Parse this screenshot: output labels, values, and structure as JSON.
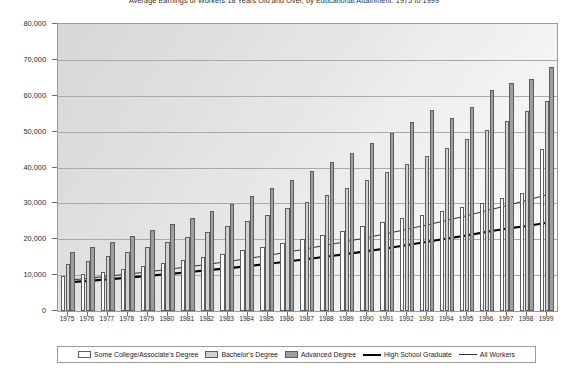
{
  "chart": {
    "title": "Average Earnings of Workers 18 Years Old and Over, by Educational Attainment: 1975 to 1999",
    "y_axis": {
      "labels": [
        "80,000",
        "70,000",
        "60,000",
        "50,000",
        "40,000",
        "30,000",
        "20,000",
        "10,000",
        "0"
      ],
      "min": 0,
      "max": 80000,
      "step": 10000
    }
  },
  "legend": {
    "position": "bottom",
    "items": [
      {
        "label": "Some College/Associate's Degree",
        "marker": "bar",
        "style": "s-some",
        "color": "#ffffff"
      },
      {
        "label": "Bachelor's Degree",
        "marker": "bar",
        "style": "s-bach",
        "color": "#d0d0d0"
      },
      {
        "label": "Advanced Degree",
        "marker": "bar",
        "style": "s-adv",
        "color": "#9e9e9e"
      },
      {
        "label": "High School Graduate",
        "marker": "line-thick",
        "style": "thick",
        "color": "#000000"
      },
      {
        "label": "All Workers",
        "marker": "line-thin",
        "style": "thin",
        "color": "#303030"
      }
    ]
  },
  "chart_data": {
    "type": "bar",
    "title": "Average Earnings of Workers 18 Years Old and Over, by Educational Attainment: 1975 to 1999",
    "xlabel": "",
    "ylabel": "",
    "ylim": [
      0,
      80000
    ],
    "grid": true,
    "legend_position": "bottom",
    "categories": [
      "1975",
      "1976",
      "1977",
      "1978",
      "1979",
      "1980",
      "1981",
      "1982",
      "1983",
      "1984",
      "1985",
      "1986",
      "1987",
      "1988",
      "1989",
      "1990",
      "1991",
      "1992",
      "1993",
      "1994",
      "1995",
      "1996",
      "1997",
      "1998",
      "1999"
    ],
    "series": [
      {
        "name": "Some College/Associate's Degree",
        "type": "bar",
        "color": "#ffffff",
        "values": [
          9700,
          10200,
          10900,
          11700,
          12600,
          13400,
          14300,
          15100,
          16000,
          16900,
          17900,
          19000,
          20100,
          21300,
          22400,
          23600,
          24700,
          25900,
          26900,
          27900,
          29100,
          30200,
          31400,
          32900,
          45200
        ]
      },
      {
        "name": "Bachelor's Degree",
        "type": "bar",
        "color": "#d0d0d0",
        "values": [
          13000,
          14000,
          15200,
          16500,
          17800,
          19200,
          20700,
          22100,
          23600,
          25200,
          26900,
          28600,
          30400,
          32400,
          34400,
          36500,
          38700,
          40900,
          43100,
          45500,
          48000,
          50500,
          53100,
          55800,
          58500
        ]
      },
      {
        "name": "Advanced Degree",
        "type": "bar",
        "color": "#9e9e9e",
        "values": [
          16500,
          17900,
          19300,
          20900,
          22500,
          24200,
          26000,
          27900,
          29900,
          32000,
          34200,
          36500,
          38900,
          41400,
          44000,
          46800,
          49700,
          52800,
          56000,
          53700,
          56900,
          61500,
          63600,
          64700,
          67900
        ]
      },
      {
        "name": "High School Graduate",
        "type": "line",
        "color": "#000000",
        "width": 2.2,
        "values": [
          8000,
          8400,
          8800,
          9300,
          9800,
          10300,
          10800,
          11400,
          11900,
          12500,
          13100,
          13800,
          14500,
          15200,
          15900,
          16700,
          17500,
          18400,
          19300,
          20200,
          21100,
          22100,
          23000,
          23700,
          24600
        ]
      },
      {
        "name": "All Workers",
        "type": "line",
        "color": "#303030",
        "width": 1,
        "values": [
          8600,
          9100,
          9700,
          10300,
          10900,
          11600,
          12300,
          13000,
          13800,
          14600,
          15500,
          16400,
          17400,
          18400,
          19400,
          20500,
          21600,
          22800,
          24000,
          25300,
          26600,
          28000,
          29400,
          30900,
          32400
        ]
      }
    ]
  }
}
